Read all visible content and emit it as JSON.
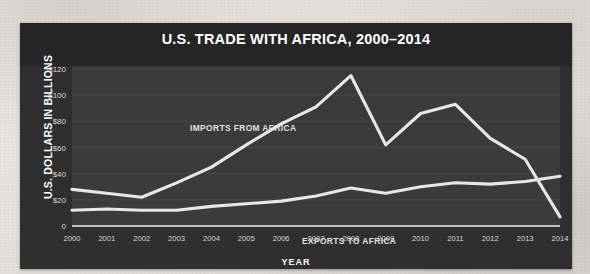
{
  "chart_data": {
    "type": "line",
    "title": "U.S. TRADE WITH AFRICA, 2000–2014",
    "xlabel": "YEAR",
    "ylabel": "U.S. DOLLARS IN BILLIONS",
    "categories": [
      "2000",
      "2001",
      "2002",
      "2003",
      "2004",
      "2005",
      "2006",
      "2007",
      "2008",
      "2009",
      "2010",
      "2011",
      "2012",
      "2013",
      "2014"
    ],
    "x": [
      2000,
      2001,
      2002,
      2003,
      2004,
      2005,
      2006,
      2007,
      2008,
      2009,
      2010,
      2011,
      2012,
      2013,
      2014
    ],
    "ylim": [
      0,
      120
    ],
    "xlim": [
      2000,
      2014
    ],
    "ytick_labels": [
      "$120",
      "$100",
      "$80",
      "$60",
      "$40",
      "$20",
      "0"
    ],
    "ytick_values": [
      120,
      100,
      80,
      60,
      40,
      20,
      0
    ],
    "grid": true,
    "legend_position": "inline-annotation",
    "series": [
      {
        "name": "IMPORTS FROM AFRICA",
        "values": [
          28,
          25,
          22,
          33,
          45,
          62,
          78,
          91,
          115,
          62,
          86,
          93,
          67,
          51,
          7
        ],
        "color": "#e9e9e7",
        "annotation": "IMPORTS FROM AFRICA"
      },
      {
        "name": "EXPORTS TO AFRICA",
        "values": [
          12,
          13,
          12,
          12,
          15,
          17,
          19,
          23,
          29,
          25,
          30,
          33,
          32,
          34,
          38
        ],
        "color": "#e9e9e7",
        "annotation": "EXPORTS TO AFRICA"
      }
    ],
    "colors": {
      "panel_background": "#2e2e2e",
      "title_band": "#242424",
      "plot_background": "#3a3a3a",
      "line": "#e9e9e7",
      "text": "#ffffff",
      "gridline": "#4a4a4a",
      "page_background": "#e8e6e2"
    }
  }
}
